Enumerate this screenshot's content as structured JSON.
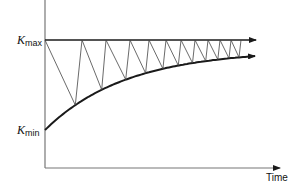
{
  "diagram": {
    "labels": {
      "k_max": {
        "symbol": "K",
        "subscript": "max"
      },
      "k_min": {
        "symbol": "K",
        "subscript": "min"
      },
      "x_axis": "Time"
    },
    "geometry": {
      "origin": [
        45,
        168
      ],
      "y_axis_top": 0,
      "x_axis_end": 280,
      "k_max_y": 40,
      "k_min_y": 130,
      "arrow_end_x": 256,
      "curve_end_y": 56
    },
    "sawtooth_tops_x": [
      45,
      82,
      106,
      130,
      149,
      166,
      181,
      195,
      208,
      220,
      231,
      241
    ],
    "colors": {
      "line": "#1a1a1a",
      "thin": "#444444"
    }
  }
}
